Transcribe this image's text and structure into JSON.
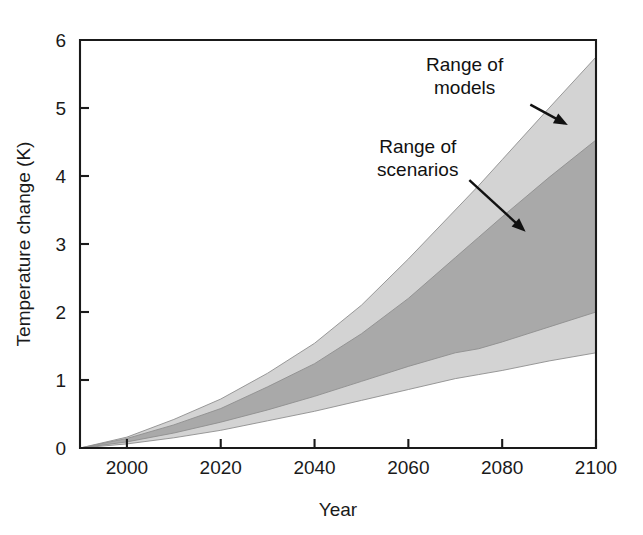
{
  "figure": {
    "background_color": "#ffffff",
    "width": 643,
    "height": 535
  },
  "chart_data": {
    "type": "area",
    "title": "",
    "subtitle": "",
    "xlabel": "Year",
    "ylabel": "Temperature change (K)",
    "xlim": [
      1990,
      2100
    ],
    "ylim": [
      0,
      6
    ],
    "xticks": [
      2000,
      2020,
      2040,
      2060,
      2080,
      2100
    ],
    "xtick_labels": [
      "2000",
      "2020",
      "2040",
      "2060",
      "2080",
      "2100"
    ],
    "yticks": [
      0,
      1,
      2,
      3,
      4,
      5,
      6
    ],
    "ytick_labels": [
      "0",
      "1",
      "2",
      "3",
      "4",
      "5",
      "6"
    ],
    "grid": false,
    "legend": "none",
    "colors": {
      "range_of_models": "#d3d3d3",
      "range_of_scenarios": "#a9a9a9",
      "axis": "#1a1a1a",
      "band_edge": "#8e8e8e"
    },
    "x": [
      1990,
      2000,
      2010,
      2020,
      2030,
      2040,
      2050,
      2060,
      2070,
      2075,
      2080,
      2090,
      2100
    ],
    "series": [
      {
        "name": "Range of models (upper bound)",
        "role": "models_upper",
        "values": [
          0.0,
          0.16,
          0.42,
          0.72,
          1.1,
          1.54,
          2.1,
          2.78,
          3.5,
          3.86,
          4.24,
          5.0,
          5.75
        ]
      },
      {
        "name": "Range of scenarios (upper bound)",
        "role": "scenarios_upper",
        "values": [
          0.0,
          0.14,
          0.34,
          0.58,
          0.9,
          1.24,
          1.68,
          2.2,
          2.8,
          3.1,
          3.4,
          3.98,
          4.53
        ]
      },
      {
        "name": "Range of scenarios (lower bound)",
        "role": "scenarios_lower",
        "values": [
          0.0,
          0.09,
          0.22,
          0.38,
          0.56,
          0.76,
          0.98,
          1.2,
          1.4,
          1.46,
          1.56,
          1.78,
          2.0
        ]
      },
      {
        "name": "Range of models (lower bound)",
        "role": "models_lower",
        "values": [
          0.0,
          0.06,
          0.15,
          0.26,
          0.4,
          0.54,
          0.7,
          0.86,
          1.02,
          1.08,
          1.14,
          1.28,
          1.4
        ]
      }
    ],
    "bands": [
      {
        "name": "Range of models",
        "fill": "#d3d3d3",
        "upper_role": "models_upper",
        "lower_role": "models_lower"
      },
      {
        "name": "Range of scenarios",
        "fill": "#a9a9a9",
        "upper_role": "scenarios_upper",
        "lower_role": "scenarios_lower"
      }
    ],
    "annotations": [
      {
        "id": "range-of-models",
        "lines": [
          "Range of",
          "models"
        ],
        "text": "Range of models",
        "text_anchor": "middle",
        "text_x": 2072,
        "text_y": 5.55,
        "arrow_from": [
          2086,
          5.05
        ],
        "arrow_to": [
          2094,
          4.75
        ]
      },
      {
        "id": "range-of-scenarios",
        "lines": [
          "Range of",
          "scenarios"
        ],
        "text": "Range of scenarios",
        "text_anchor": "middle",
        "text_x": 2062,
        "text_y": 4.34,
        "arrow_from": [
          2073,
          3.94
        ],
        "arrow_to": [
          2085,
          3.18
        ]
      }
    ]
  }
}
